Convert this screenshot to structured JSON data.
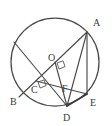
{
  "figure": {
    "kind": "circle-geometry-diagram",
    "background_color": "#ffffff",
    "stroke_color": "#4a4a4a",
    "label_color": "#3b3b3b",
    "circle": {
      "center_label": "O",
      "center_x": 55,
      "center_y": 62,
      "radius": 44
    },
    "points": [
      {
        "id": "A",
        "label": "A",
        "x": 87,
        "y": 32,
        "label_x": 93,
        "label_y": 26,
        "on_circle": true
      },
      {
        "id": "B",
        "label": "B",
        "x": 19,
        "y": 97,
        "label_x": 10,
        "label_y": 105,
        "on_circle": true
      },
      {
        "id": "C",
        "label": "C",
        "x": 36,
        "y": 81,
        "label_x": 31,
        "label_y": 93,
        "on_circle": false
      },
      {
        "id": "D",
        "label": "D",
        "x": 67,
        "y": 106,
        "label_x": 63,
        "label_y": 121,
        "on_circle": true
      },
      {
        "id": "E",
        "label": "E",
        "x": 87,
        "y": 94,
        "label_x": 90,
        "label_y": 106,
        "on_circle": true
      },
      {
        "id": "F",
        "label": "F",
        "x": 66,
        "y": 84,
        "label_x": 62,
        "label_y": 92,
        "on_circle": false
      },
      {
        "id": "O",
        "label": "O",
        "x": 55,
        "y": 62,
        "label_x": 48,
        "label_y": 61,
        "on_circle": false
      },
      {
        "id": "G",
        "label": "",
        "x": 14,
        "y": 42,
        "label_x": 0,
        "label_y": 0,
        "on_circle": true
      }
    ],
    "segments": [
      {
        "name": "segment-B-A",
        "from": "B",
        "to": "A",
        "weight": "normal"
      },
      {
        "name": "segment-G-D",
        "from": "G",
        "to": "D",
        "weight": "normal"
      },
      {
        "name": "segment-A-D",
        "from": "A",
        "to": "D",
        "weight": "normal"
      },
      {
        "name": "segment-A-E",
        "from": "A",
        "to": "E",
        "weight": "normal"
      },
      {
        "name": "segment-C-E",
        "from": "C",
        "to": "E",
        "weight": "normal"
      },
      {
        "name": "segment-O-D",
        "from": "O",
        "to": "D",
        "weight": "normal"
      },
      {
        "name": "segment-D-E",
        "from": "D",
        "to": "E",
        "weight": "bold"
      }
    ],
    "right_angles": [
      {
        "name": "right-angle-at-O",
        "vertex": "O",
        "size": 6
      },
      {
        "name": "right-angle-at-C",
        "vertex": "C",
        "size": 6
      }
    ]
  }
}
